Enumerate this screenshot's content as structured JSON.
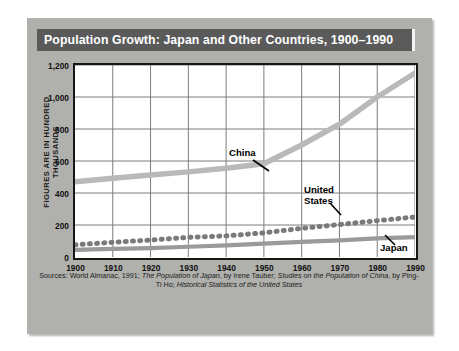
{
  "title": "Population Growth: Japan and Other Countries, 1900–1990",
  "y_axis_caption": "FIGURES ARE IN HUNDRED THOUSANDS",
  "annotations": {
    "china": "China",
    "united_states_line1": "United",
    "united_states_line2": "States",
    "japan": "Japan"
  },
  "sources": {
    "line1_a": "Sources: World Almanac, 1991; ",
    "line1_b": "The Population of Japan",
    "line1_c": ", by Irene Tauber; ",
    "line1_d": "Studies on the",
    "line2_a": "Population of China",
    "line2_b": ", by Ping-Ti Ho; ",
    "line2_c": "Historical Statistics of the United States"
  },
  "colors": {
    "panel": "#b0b0ac",
    "title_bar": "#5a5a5a",
    "plot_background": "#ffffff",
    "frame": "#161616",
    "gridline": "#7c7c7c",
    "china_line": "#b9b9b9",
    "united_states_line": "#7a7a7a",
    "japan_line": "#9a9a9a"
  },
  "chart_data": {
    "type": "line",
    "title": "Population Growth: Japan and Other Countries, 1900–1990",
    "xlabel": "",
    "ylabel": "FIGURES ARE IN HUNDRED THOUSANDS",
    "x": [
      1900,
      1910,
      1920,
      1930,
      1940,
      1950,
      1960,
      1970,
      1980,
      1990
    ],
    "xlim": [
      1900,
      1990
    ],
    "ylim": [
      0,
      1200
    ],
    "yticks": [
      0,
      200,
      400,
      600,
      800,
      1000,
      1200
    ],
    "ytick_labels": [
      "0",
      "200",
      "400",
      "600",
      "800",
      "1,000",
      "1,200"
    ],
    "xtick_labels": [
      "1900",
      "1910",
      "1920",
      "1930",
      "1940",
      "1950",
      "1960",
      "1970",
      "1980",
      "1990"
    ],
    "grid": true,
    "legend": "inline-annotations",
    "series": [
      {
        "name": "China",
        "style": "solid-thick",
        "values": [
          470,
          492,
          512,
          532,
          555,
          583,
          700,
          830,
          1000,
          1150
        ]
      },
      {
        "name": "United States",
        "style": "dotted",
        "values": [
          76,
          92,
          106,
          123,
          132,
          151,
          179,
          203,
          227,
          250
        ]
      },
      {
        "name": "Japan",
        "style": "solid",
        "values": [
          45,
          51,
          56,
          64,
          73,
          83,
          94,
          104,
          117,
          124
        ]
      }
    ]
  }
}
